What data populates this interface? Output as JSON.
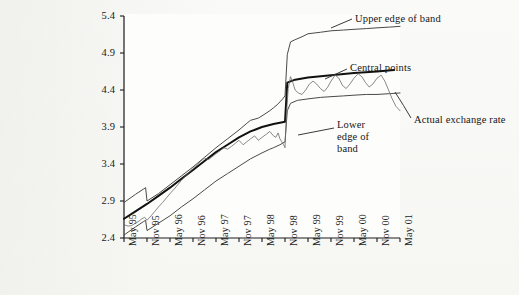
{
  "figure": {
    "background_color": "#f6f6f4",
    "plot_background_color": "#fdfdfc",
    "axis_color": "#1a1a1a",
    "band_line_color": "#4a4a4a",
    "central_line_color": "#111111",
    "actual_line_color": "#6b6b6b"
  },
  "annotations": {
    "upper_edge": "Upper edge of band",
    "central_points": "Central points",
    "lower_edge": "Lower edge of\nband",
    "lower_edge_first": "Lower",
    "lower_edge_rest": "edge of\nband",
    "actual_rate": "Actual exchange rate"
  },
  "chart_data": {
    "type": "line",
    "title": "",
    "xlabel": "",
    "ylabel": "",
    "grid": false,
    "legend_position": "inline-annotations",
    "ylim": [
      2.4,
      5.4
    ],
    "yticks": [
      "2.4",
      "2.9",
      "3.4",
      "3.9",
      "4.4",
      "4.9",
      "5.4"
    ],
    "ytick_values": [
      2.4,
      2.9,
      3.4,
      3.9,
      4.4,
      4.9,
      5.4
    ],
    "xticks": [
      "May 95",
      "Nov 95",
      "May 96",
      "Nov 96",
      "May 97",
      "Nov 97",
      "May 98",
      "Nov 98",
      "May 99",
      "Nov 99",
      "May 00",
      "Nov 00",
      "May 01"
    ],
    "xtick_values": [
      1995.33,
      1995.83,
      1996.33,
      1996.83,
      1997.33,
      1997.83,
      1998.33,
      1998.83,
      1999.33,
      1999.83,
      2000.33,
      2000.83,
      2001.33
    ],
    "xlim": [
      1995.33,
      2001.33
    ],
    "series": [
      {
        "name": "Upper edge of band",
        "style": "solid-thin",
        "x": [
          1995.33,
          1995.58,
          1995.75,
          1995.8,
          1995.83,
          1996.08,
          1996.33,
          1996.58,
          1996.83,
          1997.08,
          1997.33,
          1997.58,
          1997.83,
          1998.0,
          1998.08,
          1998.25,
          1998.33,
          1998.5,
          1998.58,
          1998.66,
          1998.72,
          1998.78,
          1998.83,
          1998.88,
          1998.95,
          1999.05,
          1999.2,
          1999.33,
          1999.6,
          1999.83,
          2000.1,
          2000.33,
          2000.6,
          2000.83,
          2001.1,
          2001.33
        ],
        "y": [
          2.88,
          2.99,
          3.06,
          3.08,
          2.9,
          3.0,
          3.12,
          3.24,
          3.36,
          3.49,
          3.62,
          3.74,
          3.86,
          3.95,
          3.99,
          4.02,
          4.05,
          4.12,
          4.16,
          4.2,
          4.24,
          4.28,
          4.32,
          4.88,
          5.05,
          5.08,
          5.12,
          5.16,
          5.18,
          5.2,
          5.21,
          5.22,
          5.23,
          5.24,
          5.25,
          5.26
        ]
      },
      {
        "name": "Central points",
        "style": "solid-thick",
        "x": [
          1995.33,
          1995.58,
          1995.83,
          1996.08,
          1996.33,
          1996.58,
          1996.83,
          1997.08,
          1997.33,
          1997.58,
          1997.83,
          1998.08,
          1998.33,
          1998.58,
          1998.83,
          1998.88,
          1999.05,
          1999.33,
          1999.83,
          2000.33,
          2000.83,
          2001.2
        ],
        "y": [
          2.66,
          2.76,
          2.86,
          2.97,
          3.08,
          3.2,
          3.32,
          3.44,
          3.56,
          3.66,
          3.76,
          3.84,
          3.9,
          3.94,
          3.97,
          4.5,
          4.54,
          4.57,
          4.6,
          4.63,
          4.65,
          4.67
        ]
      },
      {
        "name": "Lower edge of band",
        "style": "solid-thin",
        "x": [
          1995.33,
          1995.58,
          1995.75,
          1995.8,
          1995.83,
          1996.08,
          1996.33,
          1996.58,
          1996.83,
          1997.08,
          1997.33,
          1997.58,
          1997.83,
          1998.08,
          1998.33,
          1998.5,
          1998.58,
          1998.72,
          1998.83,
          1998.88,
          1998.95,
          1999.1,
          1999.33,
          1999.6,
          1999.83,
          2000.1,
          2000.33,
          2000.6,
          2000.83,
          2001.1,
          2001.33
        ],
        "y": [
          2.44,
          2.55,
          2.62,
          2.64,
          2.5,
          2.6,
          2.7,
          2.82,
          2.93,
          3.05,
          3.17,
          3.27,
          3.37,
          3.47,
          3.55,
          3.6,
          3.62,
          3.66,
          3.7,
          4.12,
          4.22,
          4.26,
          4.28,
          4.3,
          4.31,
          4.32,
          4.33,
          4.34,
          4.34,
          4.35,
          4.36
        ]
      },
      {
        "name": "Actual exchange rate",
        "style": "solid-hairline",
        "x": [
          1995.33,
          1995.42,
          1995.5,
          1995.58,
          1995.66,
          1995.72,
          1995.78,
          1995.83,
          1995.92,
          1996.0,
          1996.08,
          1996.17,
          1996.25,
          1996.33,
          1996.42,
          1996.5,
          1996.58,
          1996.67,
          1996.75,
          1996.83,
          1996.92,
          1997.0,
          1997.08,
          1997.17,
          1997.25,
          1997.33,
          1997.42,
          1997.5,
          1997.58,
          1997.67,
          1997.75,
          1997.83,
          1997.92,
          1998.0,
          1998.08,
          1998.17,
          1998.25,
          1998.33,
          1998.42,
          1998.5,
          1998.58,
          1998.63,
          1998.68,
          1998.72,
          1998.76,
          1998.8,
          1998.83,
          1998.86,
          1998.9,
          1998.95,
          1999.0,
          1999.05,
          1999.12,
          1999.2,
          1999.28,
          1999.36,
          1999.44,
          1999.52,
          1999.6,
          1999.68,
          1999.76,
          1999.83,
          1999.92,
          2000.0,
          2000.08,
          2000.16,
          2000.24,
          2000.33,
          2000.42,
          2000.5,
          2000.58,
          2000.66,
          2000.74,
          2000.83,
          2000.92,
          2001.0,
          2001.08,
          2001.16,
          2001.24,
          2001.33
        ],
        "y": [
          2.58,
          2.56,
          2.57,
          2.6,
          2.63,
          2.66,
          2.68,
          2.64,
          2.7,
          2.76,
          2.82,
          2.88,
          2.94,
          3.0,
          3.06,
          3.12,
          3.18,
          3.24,
          3.29,
          3.34,
          3.39,
          3.44,
          3.48,
          3.46,
          3.5,
          3.54,
          3.58,
          3.62,
          3.6,
          3.64,
          3.68,
          3.72,
          3.66,
          3.7,
          3.74,
          3.78,
          3.72,
          3.76,
          3.8,
          3.84,
          3.78,
          3.76,
          3.82,
          3.74,
          3.7,
          3.66,
          3.62,
          4.05,
          4.42,
          4.58,
          4.5,
          4.4,
          4.36,
          4.34,
          4.4,
          4.48,
          4.52,
          4.48,
          4.42,
          4.38,
          4.44,
          4.52,
          4.6,
          4.56,
          4.46,
          4.42,
          4.48,
          4.56,
          4.62,
          4.58,
          4.5,
          4.44,
          4.48,
          4.56,
          4.6,
          4.52,
          4.4,
          4.28,
          4.18,
          4.12
        ]
      }
    ]
  }
}
